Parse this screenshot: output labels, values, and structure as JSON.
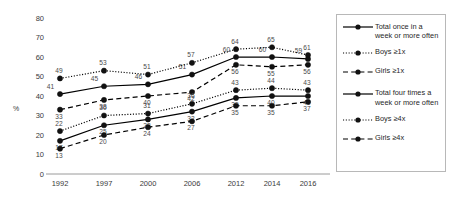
{
  "chart_data": {
    "type": "line",
    "title": "",
    "xlabel": "",
    "ylabel": "%",
    "categories": [
      "1992",
      "1997",
      "2000",
      "2006",
      "2012",
      "2014",
      "2016"
    ],
    "ylim": [
      0,
      80
    ],
    "yticks": [
      0,
      10,
      20,
      30,
      40,
      50,
      60,
      70,
      80
    ],
    "grid": false,
    "legend_position": "right",
    "series": [
      {
        "name": "Total once in a week or more often",
        "legend_label": "Total once in a\nweek or more often",
        "style": "solid",
        "values": [
          41,
          45,
          46,
          51,
          60,
          60,
          59
        ]
      },
      {
        "name": "Boys ≥1x",
        "legend_label": "Boys ≥1x",
        "style": "dotted",
        "values": [
          49,
          53,
          51,
          57,
          64,
          65,
          61
        ]
      },
      {
        "name": "Girls ≥1x",
        "legend_label": "Girls ≥1x",
        "style": "dashed",
        "values": [
          33,
          38,
          40,
          42,
          56,
          55,
          56
        ]
      },
      {
        "name": "Total four times a week or more often",
        "legend_label": "Total four times a\nweek or more often",
        "style": "solid",
        "values": [
          17,
          25,
          28,
          32,
          39,
          40,
          40
        ]
      },
      {
        "name": "Boys ≥4x",
        "legend_label": "Boys ≥4x",
        "style": "dotted",
        "values": [
          22,
          30,
          31,
          36,
          43,
          44,
          43
        ]
      },
      {
        "name": "Girls ≥4x",
        "legend_label": "Girls ≥4x",
        "style": "dashed",
        "values": [
          13,
          20,
          24,
          27,
          35,
          35,
          37
        ]
      }
    ],
    "colors": {
      "line": "#000000",
      "marker": "#111111",
      "axis": "#9a9a9a",
      "tick_text": "#3a3a3a",
      "data_label": "#4a4a4a"
    }
  }
}
